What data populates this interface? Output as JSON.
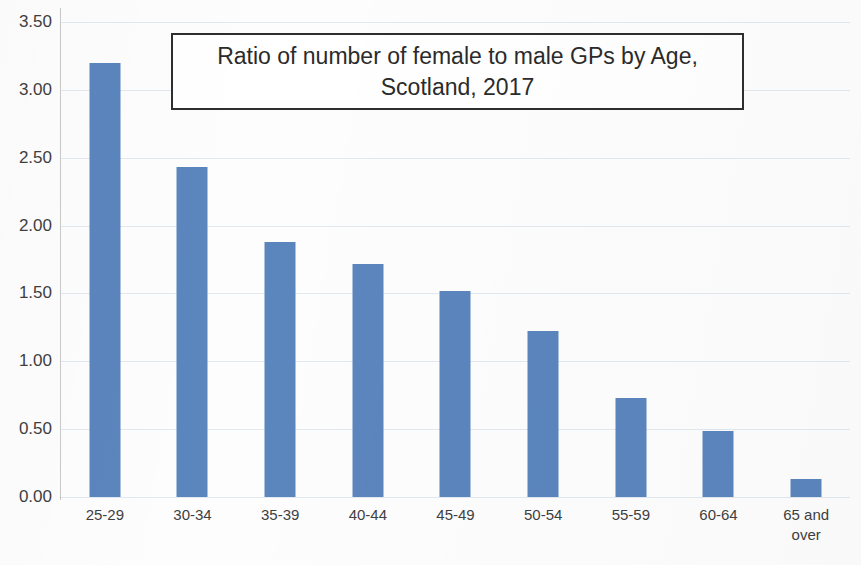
{
  "chart_data": {
    "type": "bar",
    "title": "Ratio of number of female to male GPs by Age,\nScotland, 2017",
    "xlabel": "",
    "ylabel": "",
    "categories": [
      "25-29",
      "30-34",
      "35-39",
      "40-44",
      "45-49",
      "50-54",
      "55-59",
      "60-64",
      "65 and\nover"
    ],
    "values": [
      3.2,
      2.43,
      1.88,
      1.72,
      1.52,
      1.22,
      0.73,
      0.49,
      0.13
    ],
    "ylim": [
      0.0,
      3.5
    ],
    "ytick_labels": [
      "3.50",
      "3.00",
      "2.50",
      "2.00",
      "1.50",
      "1.00",
      "0.50",
      "0.00"
    ],
    "ytick_values": [
      3.5,
      3.0,
      2.5,
      2.0,
      1.5,
      1.0,
      0.5,
      0.0
    ],
    "grid": true,
    "legend": false,
    "bar_color": "#5b85bd",
    "gridline_color": "#e2e8ef",
    "axis_color": "#c9c9c9",
    "title_border_color": "#2e2e2e"
  }
}
